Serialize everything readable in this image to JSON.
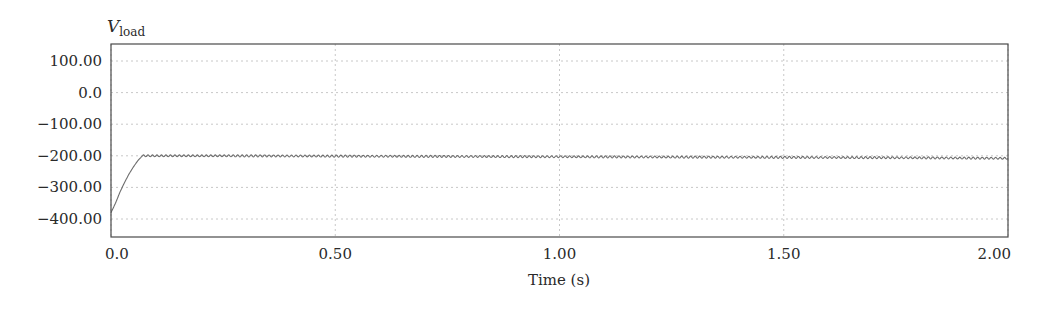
{
  "chart_data": {
    "type": "line",
    "title": "",
    "ylabel": "V",
    "ylabel_subscript": "load",
    "xlabel": "Time (s)",
    "xlim": [
      0.0,
      2.0
    ],
    "ylim": [
      -450,
      150
    ],
    "grid": true,
    "legend": "none",
    "x_ticks": [
      0.0,
      0.5,
      1.0,
      1.5,
      2.0
    ],
    "x_tick_labels": [
      "0.0",
      "0.50",
      "1.00",
      "1.50",
      "2.00"
    ],
    "y_ticks": [
      100,
      0,
      -100,
      -200,
      -300,
      -400
    ],
    "y_tick_labels": [
      "100.00",
      "0.0",
      "−100.00",
      "−200.00",
      "−300.00",
      "−400.00"
    ],
    "series": [
      {
        "name": "V_load",
        "color": "#6e6e6e",
        "description": "Starts near -380 V at t=0, rises roughly linearly to about -200 V by t≈0.07 s, then holds near -200 V with a small ripple (±3 V), drifting slightly to about -208 V by t=2.0 s",
        "x": [
          0.0,
          0.01,
          0.02,
          0.03,
          0.04,
          0.05,
          0.06,
          0.07,
          0.1,
          0.25,
          0.5,
          0.75,
          1.0,
          1.25,
          1.5,
          1.75,
          2.0
        ],
        "y": [
          -380,
          -350,
          -315,
          -285,
          -258,
          -235,
          -215,
          -200,
          -200,
          -200,
          -201,
          -202,
          -203,
          -204,
          -205,
          -206,
          -208
        ],
        "ripple_amplitude": 3
      }
    ]
  },
  "plot_area": {
    "left": 111,
    "top": 44,
    "right": 1008,
    "bottom": 237
  },
  "colors": {
    "axis": "#4a4a4a",
    "grid": "#c8c8c8",
    "trace": "#6e6e6e",
    "text": "#2a2a2a"
  }
}
